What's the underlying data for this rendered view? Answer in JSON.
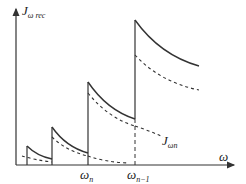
{
  "diagram": {
    "y_axis": {
      "symbol": "J",
      "subscript": "ω rec"
    },
    "x_axis": {
      "symbol": "ω"
    },
    "curve_label": {
      "symbol": "J",
      "subscript": "ωn"
    },
    "ticks": [
      {
        "symbol": "ω",
        "subscript": "n"
      },
      {
        "symbol": "ω",
        "subscript": "n−1"
      }
    ],
    "colors": {
      "line": "#333333",
      "background": "#ffffff"
    },
    "steps": [
      {
        "x_start": 27,
        "top": 146,
        "x_end": 52,
        "bottom": 159,
        "dash_top": 155,
        "dash_bottom": 162
      },
      {
        "x_start": 52,
        "top": 127,
        "x_end": 88,
        "bottom": 153,
        "dash_top": 137,
        "dash_bottom": 156
      },
      {
        "x_start": 88,
        "top": 82,
        "x_end": 135,
        "bottom": 119,
        "dash_top": 93,
        "dash_bottom": 126
      },
      {
        "x_start": 135,
        "top": 20,
        "x_end": 199,
        "bottom": 66,
        "dash_top": 55,
        "dash_bottom": 90
      }
    ]
  }
}
